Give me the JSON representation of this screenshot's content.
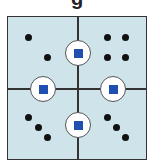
{
  "title": {
    "text": "g"
  },
  "diagram": {
    "background_color": "#cfe3ea",
    "line_color": "#333333",
    "square_color": "#1f4fb0",
    "dot_color": "#111111",
    "quadrants": [
      {
        "name": "top-left",
        "dot_count": 2,
        "arrangement": "diagonal"
      },
      {
        "name": "top-right",
        "dot_count": 4,
        "arrangement": "2x2 grid"
      },
      {
        "name": "bottom-left",
        "dot_count": 3,
        "arrangement": "diagonal"
      },
      {
        "name": "bottom-right",
        "dot_count": 3,
        "arrangement": "diagonal"
      }
    ],
    "nodes": [
      {
        "name": "top",
        "shape": "circle with blue square"
      },
      {
        "name": "left",
        "shape": "circle with blue square"
      },
      {
        "name": "right",
        "shape": "circle with blue square"
      },
      {
        "name": "bottom",
        "shape": "circle with blue square"
      }
    ]
  }
}
